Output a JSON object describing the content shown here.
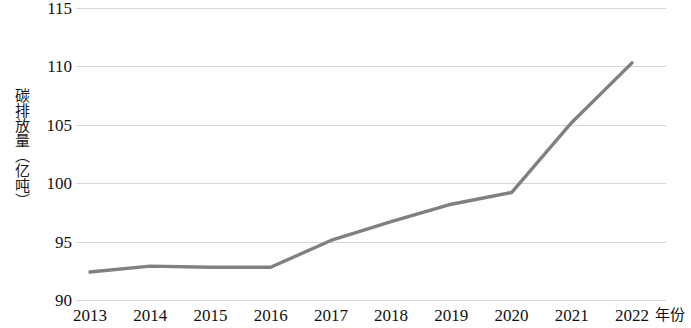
{
  "chart_data": {
    "type": "line",
    "title": "",
    "subtitle": "",
    "xlabel": "年份",
    "ylabel": "碳排放量（亿吨）",
    "categories": [
      "2013",
      "2014",
      "2015",
      "2016",
      "2017",
      "2018",
      "2019",
      "2020",
      "2021",
      "2022"
    ],
    "x": [
      2013,
      2014,
      2015,
      2016,
      2017,
      2018,
      2019,
      2020,
      2021,
      2022
    ],
    "values": [
      92.4,
      92.9,
      92.8,
      92.8,
      95.1,
      96.7,
      98.2,
      99.2,
      105.2,
      110.3
    ],
    "series": [
      {
        "name": "碳排放量",
        "values": [
          92.4,
          92.9,
          92.8,
          92.8,
          95.1,
          96.7,
          98.2,
          99.2,
          105.2,
          110.3
        ],
        "color": "#808080"
      }
    ],
    "ylim": [
      90,
      115
    ],
    "xlim": [
      2013,
      2022
    ],
    "y_ticks": [
      90,
      95,
      100,
      105,
      110,
      115
    ],
    "y_tick_labels": [
      "90",
      "95",
      "100",
      "105",
      "110",
      "115"
    ],
    "x_ticks": [
      2013,
      2014,
      2015,
      2016,
      2017,
      2018,
      2019,
      2020,
      2021,
      2022
    ],
    "grid": true,
    "grid_axis": "y",
    "grid_color": "#d6d6dd",
    "legend": false,
    "legend_position": "none",
    "markers": false,
    "line_width": 3.4,
    "annotations": []
  },
  "axis": {
    "y_title": "碳排放量（亿吨）",
    "x_title": "年份"
  }
}
